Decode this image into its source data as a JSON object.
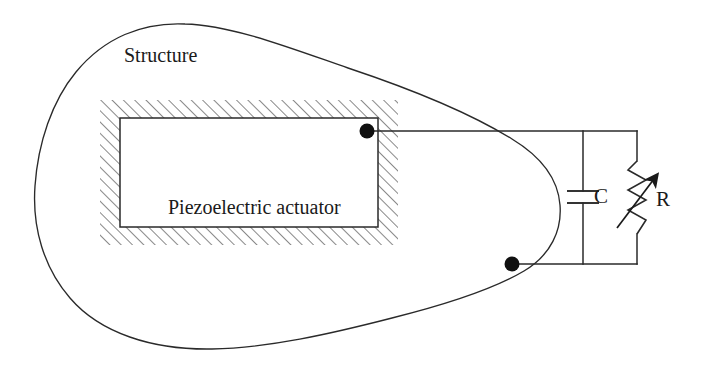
{
  "figure": {
    "type": "schematic-diagram",
    "background_color": "#ffffff",
    "line_color": "#2a2a2a",
    "hatch_color": "#555555"
  },
  "labels": {
    "structure": "Structure",
    "actuator": "Piezoelectric actuator",
    "capacitor": "C",
    "resistor": "R"
  },
  "components": {
    "structure_outline": {
      "name": "structure",
      "shape": "irregular-closed-blob",
      "stroke": "#2a2a2a",
      "stroke_width": 1.3,
      "fill": "none"
    },
    "actuator_block": {
      "name": "piezoelectric-actuator",
      "hatched_band": {
        "x": 100,
        "y": 100,
        "width": 298,
        "height": 145
      },
      "inner_rect": {
        "x": 120,
        "y": 118,
        "width": 258,
        "height": 109
      },
      "hatch_spacing": 8,
      "hatch_angle_deg": -45
    },
    "terminal_dots": [
      {
        "name": "upper-terminal",
        "cx": 367,
        "cy": 131,
        "r": 7
      },
      {
        "name": "lower-terminal",
        "cx": 512,
        "cy": 264,
        "r": 7
      }
    ],
    "wires": [
      {
        "name": "top-wire",
        "x1": 367,
        "y1": 131,
        "x2": 637,
        "y2": 131
      },
      {
        "name": "bottom-wire",
        "x1": 512,
        "y1": 264,
        "x2": 637,
        "y2": 264
      },
      {
        "name": "capacitor-branch-upper",
        "x1": 583,
        "y1": 131,
        "x2": 583,
        "y2": 191
      },
      {
        "name": "capacitor-branch-lower",
        "x1": 583,
        "y1": 203,
        "x2": 583,
        "y2": 264
      },
      {
        "name": "resistor-branch-upper",
        "x1": 637,
        "y1": 131,
        "x2": 637,
        "y2": 161
      },
      {
        "name": "resistor-branch-lower",
        "x1": 637,
        "y1": 234,
        "x2": 637,
        "y2": 264
      }
    ],
    "capacitor": {
      "name": "capacitor",
      "symbol": "parallel-plates",
      "plate_top_y": 191,
      "plate_bottom_y": 203,
      "plate_x1": 567,
      "plate_x2": 599
    },
    "resistor": {
      "name": "variable-resistor",
      "symbol": "zigzag-with-diagonal-arrow",
      "zigzag_top_y": 161,
      "zigzag_bottom_y": 234,
      "center_x": 637,
      "zigzag_amplitude": 9,
      "arrow": {
        "x1": 617,
        "y1": 228,
        "x2": 659,
        "y2": 173
      }
    }
  }
}
